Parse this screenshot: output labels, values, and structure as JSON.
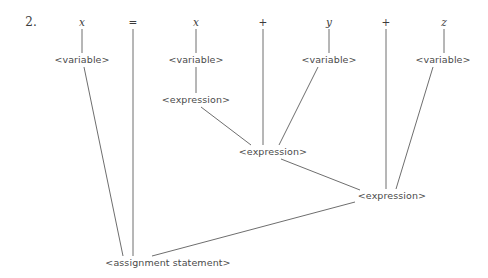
{
  "item": {
    "number_label": "2."
  },
  "diagram": {
    "type": "parse-tree",
    "line_color": "#6e6e6e",
    "text_color": "#4a4a4a",
    "background": "#ffffff",
    "terminals": [
      {
        "id": "t-x1",
        "label": "x",
        "kind": "variable",
        "x": 82,
        "y": 22
      },
      {
        "id": "t-eq",
        "label": "=",
        "kind": "operator",
        "x": 133,
        "y": 22
      },
      {
        "id": "t-x2",
        "label": "x",
        "kind": "variable",
        "x": 196,
        "y": 22
      },
      {
        "id": "t-p1",
        "label": "+",
        "kind": "operator",
        "x": 263,
        "y": 22
      },
      {
        "id": "t-y",
        "label": "y",
        "kind": "variable",
        "x": 329,
        "y": 22
      },
      {
        "id": "t-p2",
        "label": "+",
        "kind": "operator",
        "x": 386,
        "y": 22
      },
      {
        "id": "t-z",
        "label": "z",
        "kind": "variable",
        "x": 444,
        "y": 22
      }
    ],
    "nonterminals": [
      {
        "id": "n-var1",
        "label": "<variable>",
        "x": 82,
        "y": 60
      },
      {
        "id": "n-var2",
        "label": "<variable>",
        "x": 196,
        "y": 60
      },
      {
        "id": "n-var3",
        "label": "<variable>",
        "x": 329,
        "y": 60
      },
      {
        "id": "n-var4",
        "label": "<variable>",
        "x": 443,
        "y": 60
      },
      {
        "id": "n-exp1",
        "label": "<expression>",
        "x": 196,
        "y": 100
      },
      {
        "id": "n-exp2",
        "label": "<expression>",
        "x": 273,
        "y": 152
      },
      {
        "id": "n-exp3",
        "label": "<expression>",
        "x": 392,
        "y": 196
      },
      {
        "id": "n-assign",
        "label": "<assignment statement>",
        "x": 168,
        "y": 263
      }
    ],
    "edges": [
      {
        "name": "edge-x1-to-variable1",
        "x1": 82,
        "y1": 29,
        "x2": 82,
        "y2": 53
      },
      {
        "name": "edge-eq-to-assignment",
        "x1": 133,
        "y1": 29,
        "x2": 133,
        "y2": 256
      },
      {
        "name": "edge-x2-to-variable2",
        "x1": 196,
        "y1": 29,
        "x2": 196,
        "y2": 53
      },
      {
        "name": "edge-plus1-to-expression2",
        "x1": 263,
        "y1": 29,
        "x2": 263,
        "y2": 145
      },
      {
        "name": "edge-y-to-variable3",
        "x1": 329,
        "y1": 29,
        "x2": 329,
        "y2": 53
      },
      {
        "name": "edge-plus2-to-expression3",
        "x1": 386,
        "y1": 29,
        "x2": 386,
        "y2": 189
      },
      {
        "name": "edge-z-to-variable4",
        "x1": 444,
        "y1": 29,
        "x2": 444,
        "y2": 53
      },
      {
        "name": "edge-variable1-to-assignment",
        "x1": 84,
        "y1": 67,
        "x2": 123,
        "y2": 256
      },
      {
        "name": "edge-variable2-to-expression1",
        "x1": 196,
        "y1": 67,
        "x2": 196,
        "y2": 93
      },
      {
        "name": "edge-variable3-to-expression2",
        "x1": 318,
        "y1": 67,
        "x2": 279,
        "y2": 145
      },
      {
        "name": "edge-variable4-to-expression3",
        "x1": 433,
        "y1": 67,
        "x2": 396,
        "y2": 189
      },
      {
        "name": "edge-expression1-to-expression2",
        "x1": 201,
        "y1": 107,
        "x2": 251,
        "y2": 145
      },
      {
        "name": "edge-expression2-to-expression3",
        "x1": 281,
        "y1": 159,
        "x2": 360,
        "y2": 190
      },
      {
        "name": "edge-expression3-to-assignment",
        "x1": 355,
        "y1": 202,
        "x2": 152,
        "y2": 256
      }
    ]
  }
}
